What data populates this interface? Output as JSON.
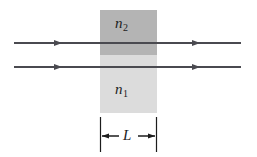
{
  "figure": {
    "type": "optics-ray-slab-diagram",
    "background_color": "#ffffff",
    "line_color": "#4a4a50"
  },
  "slab": {
    "name": "slab",
    "x": 100,
    "y": 10,
    "width": 57,
    "height": 103,
    "upper_region": {
      "label_base": "n",
      "label_sub": "2",
      "label_full": "n2",
      "fill_color": "#b4b4b4",
      "y": 10,
      "height": 45
    },
    "lower_region": {
      "label_base": "n",
      "label_sub": "1",
      "label_full": "n1",
      "fill_color": "#dcdcdc",
      "y": 55,
      "height": 58
    }
  },
  "rays": [
    {
      "name": "upper-ray",
      "y": 43,
      "x_start": 14,
      "x_end": 241,
      "arrowheads_at": [
        62,
        200
      ]
    },
    {
      "name": "lower-ray",
      "y": 67,
      "x_start": 14,
      "x_end": 241,
      "arrowheads_at": [
        62,
        200
      ]
    }
  ],
  "dimension": {
    "name": "thickness-dimension",
    "label": "L",
    "value_label": "L",
    "y": 136,
    "left_x": 100,
    "right_x": 157,
    "extension_line_top": 117,
    "extension_line_bottom": 152,
    "arrow_direction": "outward"
  }
}
